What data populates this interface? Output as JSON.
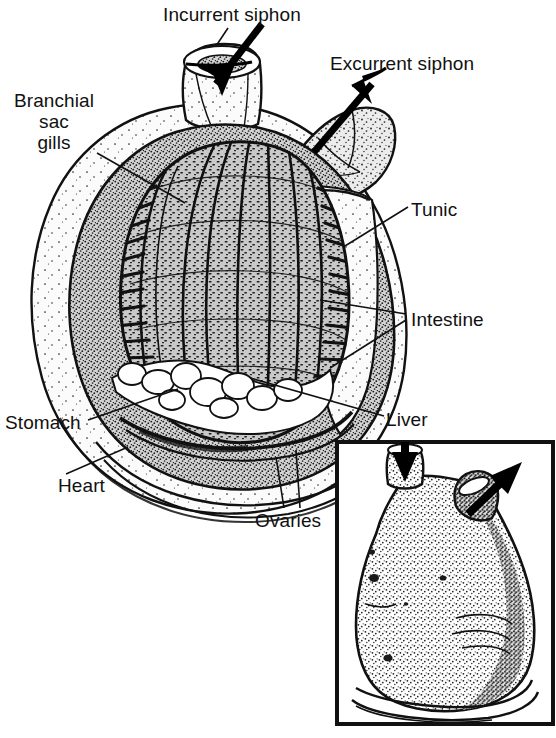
{
  "figure": {
    "style": "black-and-white line drawing with stipple shading",
    "background_color": "#ffffff",
    "ink_color": "#111111",
    "tunic_fill": "#f2f2f2",
    "body_fill": "#cfcfcf",
    "organ_fill": "#e8e8e8",
    "white_fill": "#ffffff"
  },
  "labels": {
    "incurrent_siphon": "Incurrent siphon",
    "excurrent_siphon": "Excurrent siphon",
    "branchial_sac_gills": "Branchial\nsac\ngills",
    "tunic": "Tunic",
    "intestine": "Intestine",
    "stomach": "Stomach",
    "liver": "Liver",
    "heart": "Heart",
    "ovaries": "Ovaries"
  },
  "label_positions": {
    "incurrent_siphon": {
      "x": 163,
      "y": 4
    },
    "excurrent_siphon": {
      "x": 330,
      "y": 53
    },
    "branchial_sac_gills": {
      "x": 8,
      "y": 90
    },
    "tunic": {
      "x": 411,
      "y": 199
    },
    "intestine": {
      "x": 411,
      "y": 309
    },
    "stomach": {
      "x": 5,
      "y": 412
    },
    "liver": {
      "x": 386,
      "y": 409
    },
    "heart": {
      "x": 58,
      "y": 475
    },
    "ovaries": {
      "x": 255,
      "y": 510
    }
  },
  "arrows": {
    "incurrent_flow": {
      "name": "incurrent water flow arrow",
      "direction": "down-left into incurrent siphon",
      "from": {
        "x": 258,
        "y": 28
      },
      "to": {
        "x": 212,
        "y": 88
      }
    },
    "excurrent_flow": {
      "name": "excurrent water flow arrow",
      "direction": "up-right out of excurrent siphon",
      "from": {
        "x": 318,
        "y": 148
      },
      "to": {
        "x": 382,
        "y": 76
      }
    },
    "inset_incurrent": {
      "name": "inset incurrent arrow",
      "direction": "down",
      "from": {
        "x": 405,
        "y": 441
      },
      "to": {
        "x": 406,
        "y": 478
      }
    },
    "inset_excurrent": {
      "name": "inset excurrent arrow",
      "direction": "up-right",
      "from": {
        "x": 470,
        "y": 512
      },
      "to": {
        "x": 516,
        "y": 470
      }
    }
  },
  "leader_lines": {
    "incurrent_siphon": [
      [
        228,
        28
      ],
      [
        216,
        46
      ]
    ],
    "branchial_sac_gills": [
      [
        97,
        153
      ],
      [
        185,
        203
      ]
    ],
    "tunic": [
      [
        408,
        207
      ],
      [
        345,
        246
      ]
    ],
    "intestine_upper": [
      [
        406,
        315
      ],
      [
        320,
        300
      ]
    ],
    "intestine_lower": [
      [
        406,
        320
      ],
      [
        330,
        368
      ]
    ],
    "stomach": [
      [
        88,
        420
      ],
      [
        178,
        389
      ]
    ],
    "liver": [
      [
        384,
        417
      ],
      [
        250,
        378
      ]
    ],
    "heart": [
      [
        66,
        474
      ],
      [
        128,
        447
      ]
    ],
    "ovaries_left": [
      [
        284,
        508
      ],
      [
        276,
        457
      ]
    ],
    "ovaries_right": [
      [
        300,
        508
      ],
      [
        296,
        450
      ]
    ]
  },
  "inset": {
    "name": "external-view-inset",
    "description": "Whole animal external view showing siphons and stippled tunic surface",
    "frame": {
      "x": 334,
      "y": 439,
      "width": 222,
      "height": 288
    },
    "border_color": "#111111",
    "border_width": 4
  },
  "anatomy_parts": [
    {
      "id": "tunic",
      "label": "Tunic",
      "description": "outer protective test covering the body"
    },
    {
      "id": "branchial-sac",
      "label": "Branchial sac gills",
      "description": "large pharyngeal basket with rows of gill slits"
    },
    {
      "id": "incurrent-siphon",
      "label": "Incurrent siphon",
      "description": "oral siphon drawing water in"
    },
    {
      "id": "excurrent-siphon",
      "label": "Excurrent siphon",
      "description": "atrial siphon expelling water"
    },
    {
      "id": "intestine",
      "label": "Intestine",
      "description": "gut loop at right of branchial basket"
    },
    {
      "id": "stomach",
      "label": "Stomach",
      "description": "digestive sac below branchial sac"
    },
    {
      "id": "liver",
      "label": "Liver",
      "description": "digestive gland near stomach"
    },
    {
      "id": "heart",
      "label": "Heart",
      "description": "ventral tubular heart at base"
    },
    {
      "id": "ovaries",
      "label": "Ovaries",
      "description": "gonads in visceral mass"
    }
  ]
}
